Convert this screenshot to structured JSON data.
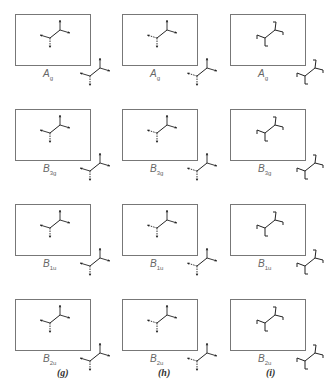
{
  "figure": {
    "columns": [
      {
        "id": "g",
        "label": "(g)"
      },
      {
        "id": "h",
        "label": "(h)"
      },
      {
        "id": "i",
        "label": "(i)"
      }
    ],
    "rows": [
      {
        "symmetry": "A",
        "sub": "g"
      },
      {
        "symmetry": "B",
        "sub": "3g"
      },
      {
        "symmetry": "B",
        "sub": "1u"
      },
      {
        "symmetry": "B",
        "sub": "2u"
      }
    ],
    "colors": {
      "line": "#222222",
      "box": "#777777",
      "label": "#666666"
    }
  }
}
